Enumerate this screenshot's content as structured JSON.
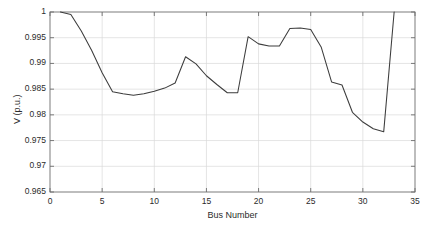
{
  "chart_data": {
    "type": "line",
    "title": "",
    "subtitle": "",
    "xlabel": "Bus Number",
    "ylabel": "V (p.u.)",
    "xlim": [
      0,
      35
    ],
    "ylim": [
      0.965,
      1
    ],
    "xticks": [
      0,
      5,
      10,
      15,
      20,
      25,
      30,
      35
    ],
    "xticklabels": [
      "0",
      "5",
      "10",
      "15",
      "20",
      "25",
      "30",
      "35"
    ],
    "yticks": [
      0.965,
      0.97,
      0.975,
      0.98,
      0.985,
      0.99,
      0.995,
      1
    ],
    "yticklabels": [
      "0.965",
      "0.97",
      "0.975",
      "0.98",
      "0.985",
      "0.99",
      "0.995",
      "1"
    ],
    "grid": true,
    "legend": null,
    "legend_position": "none",
    "line_color": "#3c3c3c",
    "grid_color": "#d9d9d9",
    "axis_color": "#6e6e6e",
    "background": "#ffffff",
    "series": [
      {
        "name": "V (p.u.)",
        "x": [
          1,
          2,
          3,
          4,
          5,
          6,
          7,
          8,
          9,
          10,
          11,
          12,
          13,
          14,
          15,
          16,
          17,
          18,
          19,
          20,
          21,
          22,
          23,
          24,
          25,
          26,
          27,
          28,
          29,
          30,
          31,
          32,
          33
        ],
        "values": [
          1.0,
          0.9995,
          0.9963,
          0.9925,
          0.9882,
          0.9845,
          0.9841,
          0.9838,
          0.9841,
          0.9846,
          0.9852,
          0.9862,
          0.9913,
          0.9899,
          0.9876,
          0.9859,
          0.9843,
          0.9843,
          0.9952,
          0.9938,
          0.9934,
          0.9934,
          0.9968,
          0.9969,
          0.9966,
          0.9932,
          0.9864,
          0.9858,
          0.9805,
          0.9786,
          0.9773,
          0.9767,
          1.0
        ]
      }
    ]
  },
  "axes": {
    "x_tick_positions_px": [
      50,
      102,
      154,
      206,
      258,
      310,
      363,
      415
    ],
    "y_tick_positions_px": [
      192,
      166,
      141,
      115,
      89,
      64,
      38,
      12
    ]
  }
}
